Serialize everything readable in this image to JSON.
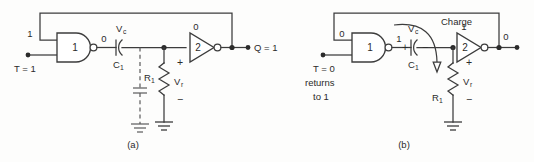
{
  "figure": {
    "colors": {
      "line": "#3c3c3c",
      "dashed_line": "#5a5a5a",
      "text": "#2b2b2b",
      "background": "#fdfdfc",
      "node": "#2b2b2b"
    },
    "panels": [
      {
        "id": "a",
        "caption": "(a)",
        "input_label": "T = 1",
        "feedback_input_value": "1",
        "nand_gate_label": "1",
        "nand_output_value": "0",
        "capacitor_label": "C",
        "capacitor_subscript": "1",
        "capacitor_voltage": "V",
        "capacitor_voltage_subscript": "c",
        "inverter_input_value": "0",
        "inverter_gate_label": "2",
        "resistor_label": "R",
        "resistor_subscript": "1",
        "resistor_voltage": "V",
        "resistor_voltage_subscript": "r",
        "polarity_plus": "+",
        "polarity_minus": "−",
        "output_label": "Q = 1"
      },
      {
        "id": "b",
        "caption": "(b)",
        "input_label_line1": "T = 0",
        "input_label_line2": "returns",
        "input_label_line3": "to 1",
        "feedback_input_value": "0",
        "nand_gate_label": "1",
        "nand_output_value": "1",
        "capacitor_label": "C",
        "capacitor_subscript": "1",
        "capacitor_voltage": "V",
        "capacitor_voltage_subscript": "c",
        "capacitor_plus": "+",
        "capacitor_minus": "−",
        "charge_label": "Charge",
        "inverter_input_value": "1",
        "inverter_gate_label": "2",
        "resistor_label": "R",
        "resistor_subscript": "1",
        "resistor_voltage": "V",
        "resistor_voltage_subscript": "r",
        "polarity_plus": "+",
        "polarity_minus": "−",
        "output_value": "0"
      }
    ]
  }
}
